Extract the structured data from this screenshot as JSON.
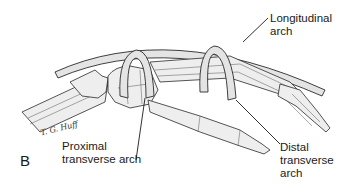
{
  "figure": {
    "panel_label": "B",
    "signature": "T. G. Huff",
    "labels": {
      "longitudinal": [
        "Longitudinal",
        "arch"
      ],
      "proximal": [
        "Proximal",
        "transverse arch"
      ],
      "distal": [
        "Distal",
        "transverse",
        "arch"
      ]
    }
  },
  "colors": {
    "bone_fill": "#eeeeee",
    "arch_band_fill": "#e4e4e4",
    "outline": "#2a2a2a",
    "text": "#1a1a1a"
  }
}
